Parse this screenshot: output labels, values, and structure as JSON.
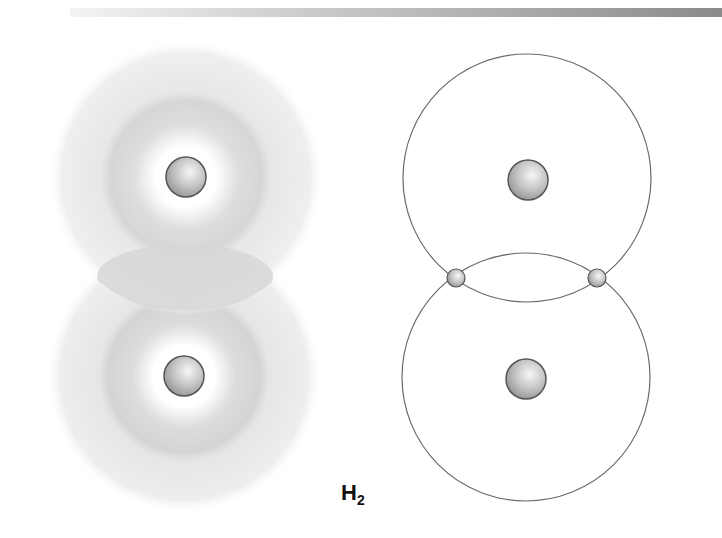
{
  "header": {
    "decorative_bar": true
  },
  "diagram": {
    "title_label": {
      "main": "H",
      "subscript": "2"
    },
    "colors": {
      "cloud_outer": "#ececec",
      "cloud_ring": "#d6d6d6",
      "overlap": "#d9d9d9",
      "nucleus_fill": "#c4c4c4",
      "nucleus_stroke": "#555555",
      "orbit_stroke": "#6a6a6a"
    },
    "left_panel": {
      "model": "electron-cloud",
      "atoms": [
        {
          "name": "hydrogen-atom-top",
          "nucleus": {
            "cx": 186,
            "cy": 177,
            "r": 20
          }
        },
        {
          "name": "hydrogen-atom-bottom",
          "nucleus": {
            "cx": 184,
            "cy": 376,
            "r": 20
          }
        }
      ]
    },
    "right_panel": {
      "model": "bohr-orbit",
      "atoms": [
        {
          "name": "hydrogen-atom-top",
          "orbit": {
            "cx": 527,
            "cy": 178,
            "r": 124
          },
          "nucleus": {
            "cx": 528,
            "cy": 180,
            "r": 20
          }
        },
        {
          "name": "hydrogen-atom-bottom",
          "orbit": {
            "cx": 526,
            "cy": 377,
            "r": 124
          },
          "nucleus": {
            "cx": 526,
            "cy": 379,
            "r": 20
          }
        }
      ],
      "shared_electrons": [
        {
          "cx": 456,
          "cy": 278,
          "r": 9
        },
        {
          "cx": 597,
          "cy": 278,
          "r": 9
        }
      ]
    }
  }
}
